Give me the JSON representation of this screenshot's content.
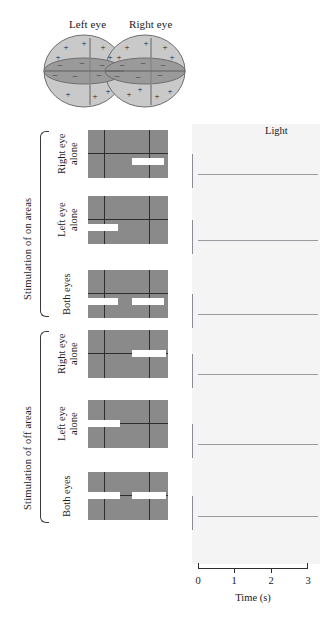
{
  "diagram": {
    "left_eye_label": "Left eye",
    "right_eye_label": "Right eye",
    "plus_sign": "+",
    "minus_sign": "–",
    "on_region_fill": "#c9c9c9",
    "off_region_fill": "#9a9a9a",
    "outline_color": "#6e6e6e"
  },
  "sections": [
    {
      "id": "on",
      "title": "Stimulation of on areas",
      "rows": [
        {
          "condition": "Right eye\nalone",
          "bar_side": "right",
          "bar_vertical": "below",
          "bars": 1
        },
        {
          "condition": "Left eye\nalone",
          "bar_side": "left",
          "bar_vertical": "below",
          "bars": 1
        },
        {
          "condition": "Both eyes",
          "bar_side": "both",
          "bar_vertical": "below",
          "bars": 2
        }
      ]
    },
    {
      "id": "off",
      "title": "Stimulation of off areas",
      "rows": [
        {
          "condition": "Right eye\nalone",
          "bar_side": "right",
          "bar_vertical": "center",
          "bars": 1
        },
        {
          "condition": "Left eye\nalone",
          "bar_side": "left",
          "bar_vertical": "center",
          "bars": 1
        },
        {
          "condition": "Both eyes",
          "bar_side": "both",
          "bar_vertical": "center",
          "bars": 2
        }
      ]
    }
  ],
  "light_label": "Light",
  "axis": {
    "title": "Time (s)",
    "ticks": [
      "0",
      "1",
      "2",
      "3"
    ],
    "tick_values": [
      0,
      1,
      2,
      3
    ],
    "xmin": 0,
    "xmax": 3
  },
  "chart_data": {
    "type": "raster",
    "xlabel": "Time (s)",
    "ylabel": "",
    "xlim": [
      0,
      3
    ],
    "legend": [
      "Light"
    ],
    "light_onset_s": 0.35,
    "light_offset_s": 1.95,
    "series": [
      {
        "name": "Stimulation of on areas – Right eye alone",
        "light_on": 0.35,
        "light_off": 1.95,
        "spike_times": [
          0.48,
          0.55,
          0.63,
          1.22,
          1.3,
          1.38
        ]
      },
      {
        "name": "Stimulation of on areas – Left eye alone",
        "light_on": 0.35,
        "light_off": 1.62,
        "spike_times": [
          0.42,
          0.52,
          0.62,
          0.71,
          0.82,
          0.98,
          1.28
        ]
      },
      {
        "name": "Stimulation of on areas – Both eyes",
        "light_on": 0.35,
        "light_off": 1.62,
        "spike_times": [
          0.38,
          0.46,
          0.52,
          0.57,
          0.61,
          0.66,
          0.7,
          0.75,
          0.8,
          0.86,
          1.08,
          1.22,
          1.36,
          1.5,
          2.35
        ]
      },
      {
        "name": "Stimulation of off areas – Right eye alone",
        "light_on": 0.35,
        "light_off": 1.62,
        "spike_times": [
          1.98,
          2.06,
          2.14,
          2.22,
          2.3,
          2.4,
          2.58
        ]
      },
      {
        "name": "Stimulation of off areas – Left eye alone",
        "light_on": 0.35,
        "light_off": 1.62,
        "spike_times": [
          2.0,
          2.08,
          2.17,
          2.26,
          2.36,
          2.52
        ]
      },
      {
        "name": "Stimulation of off areas – Both eyes",
        "light_on": 0.35,
        "light_off": 1.62,
        "spike_times": [
          1.96,
          2.0,
          2.04,
          2.08,
          2.12,
          2.16,
          2.2,
          2.25,
          2.34,
          2.44,
          2.52,
          2.62,
          2.74
        ]
      }
    ]
  }
}
